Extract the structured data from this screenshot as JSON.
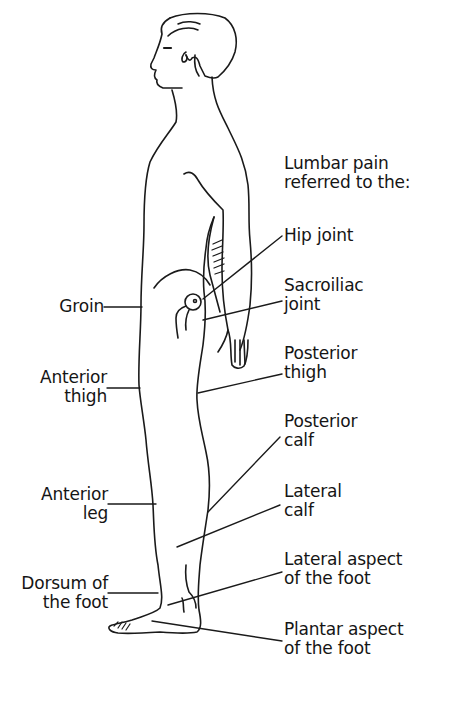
{
  "diagram": {
    "heading": {
      "line1": "Lumbar pain",
      "line2": "referred to the:"
    },
    "right_labels": [
      {
        "id": "hip-joint",
        "line1": "Hip joint",
        "line2": ""
      },
      {
        "id": "sacroiliac-joint",
        "line1": "Sacroiliac",
        "line2": "joint"
      },
      {
        "id": "posterior-thigh",
        "line1": "Posterior",
        "line2": "thigh"
      },
      {
        "id": "posterior-calf",
        "line1": "Posterior",
        "line2": "calf"
      },
      {
        "id": "lateral-calf",
        "line1": "Lateral",
        "line2": "calf"
      },
      {
        "id": "lateral-aspect-foot",
        "line1": "Lateral aspect",
        "line2": "of the foot"
      },
      {
        "id": "plantar-aspect-foot",
        "line1": "Plantar aspect",
        "line2": "of the foot"
      }
    ],
    "left_labels": [
      {
        "id": "groin",
        "line1": "Groin",
        "line2": ""
      },
      {
        "id": "anterior-thigh",
        "line1": "Anterior",
        "line2": "thigh"
      },
      {
        "id": "anterior-leg",
        "line1": "Anterior",
        "line2": "leg"
      },
      {
        "id": "dorsum-foot",
        "line1": "Dorsum of",
        "line2": "the foot"
      }
    ],
    "colors": {
      "line": "#1a1a1a",
      "background": "#ffffff"
    }
  }
}
